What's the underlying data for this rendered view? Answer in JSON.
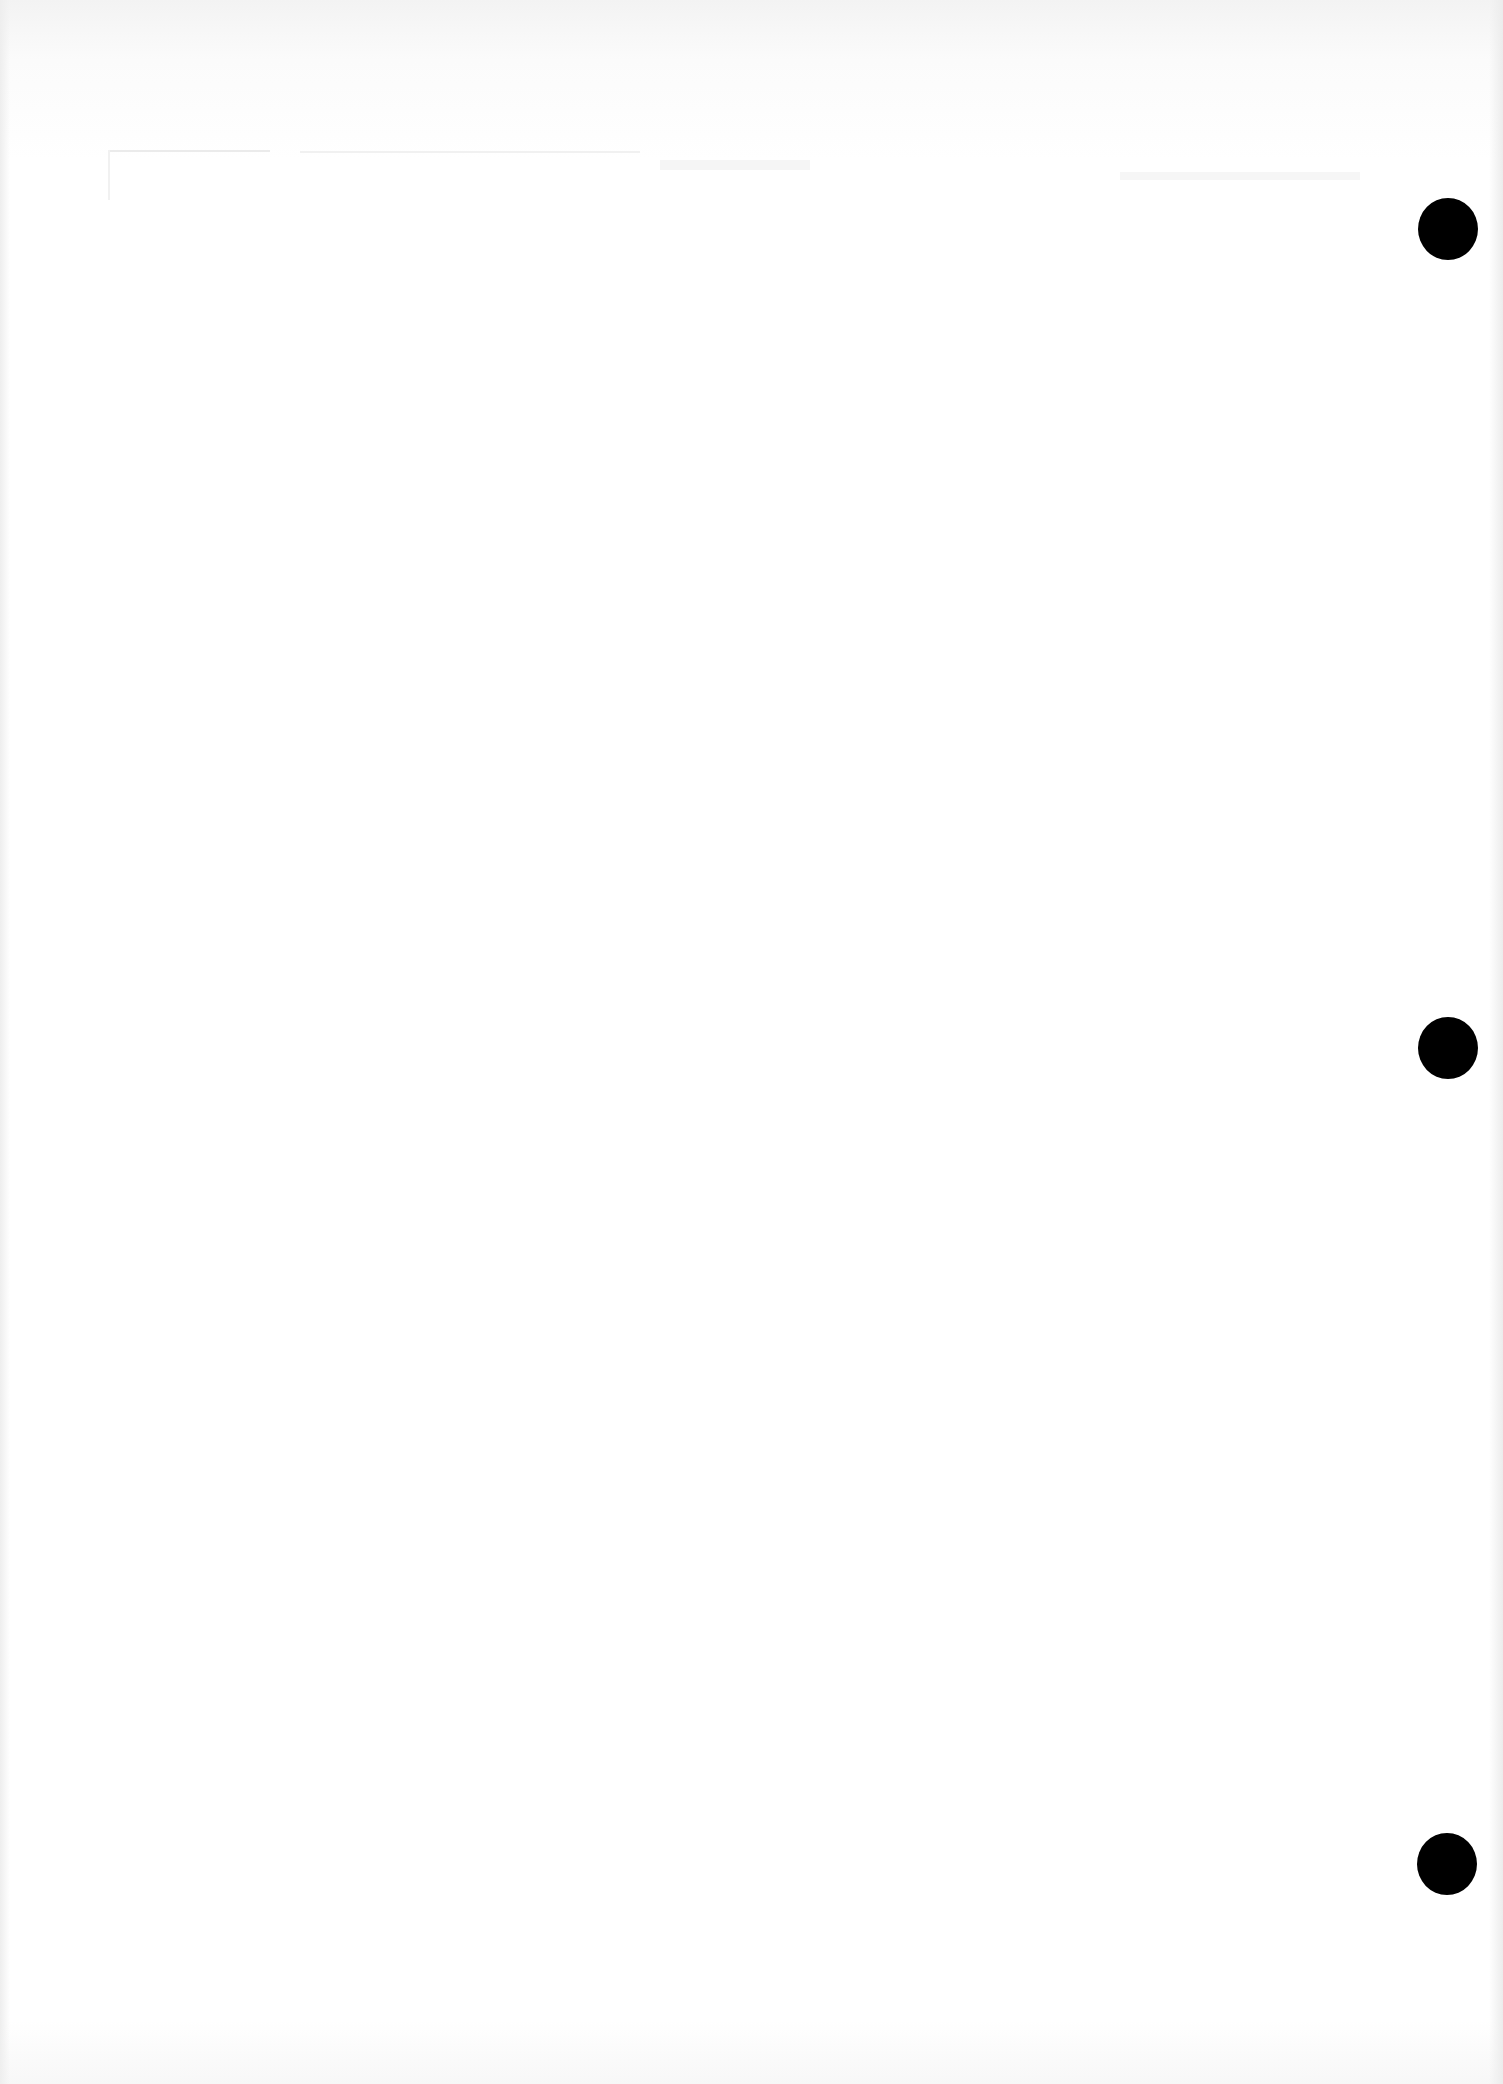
{
  "document": {
    "type": "scanned-page",
    "content_text": "",
    "background_color": "#ffffff",
    "punch_holes": [
      {
        "x": 1418,
        "y": 198,
        "diameter": 60,
        "color": "#000000"
      },
      {
        "x": 1418,
        "y": 1017,
        "diameter": 60,
        "color": "#000000"
      },
      {
        "x": 1417,
        "y": 1833,
        "diameter": 60,
        "color": "#000000"
      }
    ]
  }
}
